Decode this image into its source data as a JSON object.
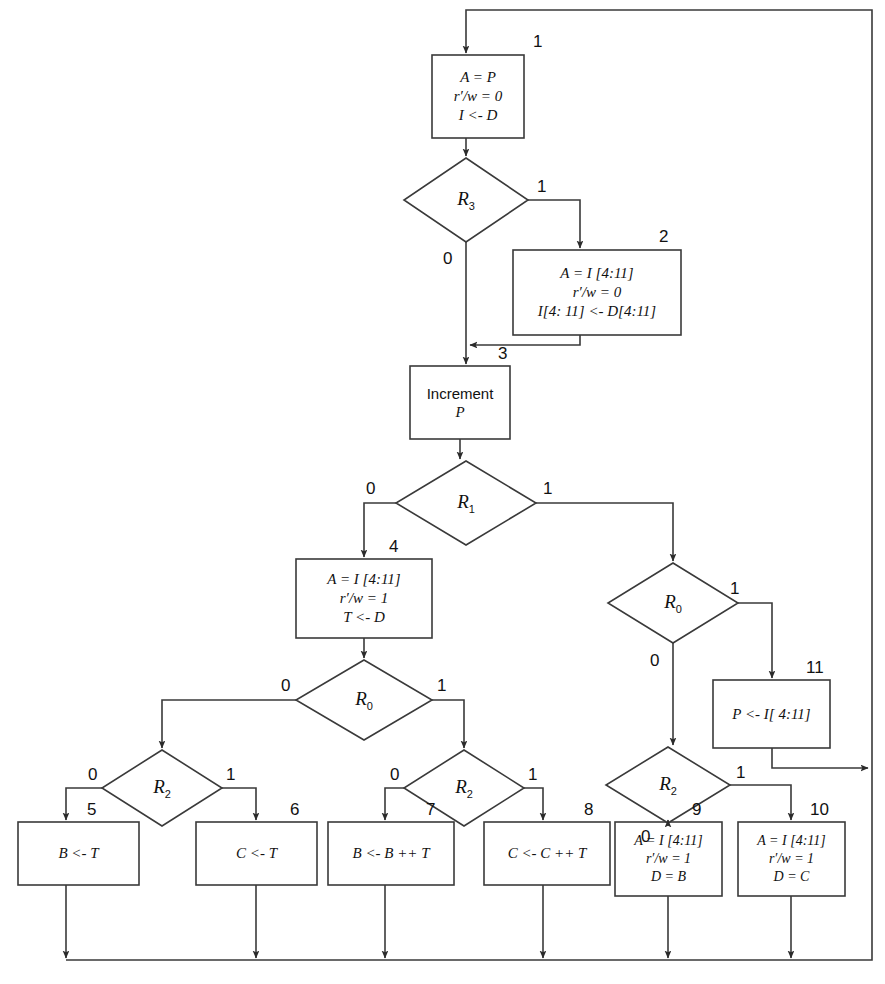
{
  "diagram": {
    "colors": {
      "line": "#3a3a3a",
      "text": "#111111",
      "background": "#ffffff"
    },
    "boxes": [
      {
        "num": "1",
        "lines": [
          "A = P",
          "r′/w = 0",
          "I <- D"
        ],
        "style": "italic"
      },
      {
        "num": "2",
        "lines": [
          "A = I [4:11]",
          "r′/w = 0",
          "I[4: 11] <- D[4:11]"
        ],
        "style": "italic"
      },
      {
        "num": "3",
        "lines": [
          "Increment",
          "P"
        ],
        "style": "plain"
      },
      {
        "num": "4",
        "lines": [
          "A = I [4:11]",
          "r′/w = 1",
          "T <- D"
        ],
        "style": "italic"
      },
      {
        "num": "5",
        "lines": [
          "B <- T"
        ],
        "style": "italic"
      },
      {
        "num": "6",
        "lines": [
          "C <- T"
        ],
        "style": "italic"
      },
      {
        "num": "7",
        "lines": [
          "B <- B ++ T"
        ],
        "style": "italic"
      },
      {
        "num": "8",
        "lines": [
          "C <- C ++ T"
        ],
        "style": "italic"
      },
      {
        "num": "9",
        "lines": [
          "A = I [4:11]",
          "r′/w = 1",
          "D = B"
        ],
        "style": "italic"
      },
      {
        "num": "10",
        "lines": [
          "A = I [4:11]",
          "r′/w = 1",
          "D = C"
        ],
        "style": "italic"
      },
      {
        "num": "11",
        "lines": [
          "P <- I[ 4:11]"
        ],
        "style": "italic"
      }
    ],
    "decisions": [
      {
        "id": "d-r3",
        "name": "R",
        "sub": "3",
        "branch_right": "1",
        "branch_bottom": "0"
      },
      {
        "id": "d-r1",
        "name": "R",
        "sub": "1",
        "branch_left": "0",
        "branch_right": "1"
      },
      {
        "id": "d-r0-mid",
        "name": "R",
        "sub": "0",
        "branch_left": "0",
        "branch_right": "1"
      },
      {
        "id": "d-r0-rgt",
        "name": "R",
        "sub": "0",
        "branch_right": "1",
        "branch_bottom": "0"
      },
      {
        "id": "d-r2-a",
        "name": "R",
        "sub": "2",
        "branch_left": "0",
        "branch_right": "1"
      },
      {
        "id": "d-r2-b",
        "name": "R",
        "sub": "2",
        "branch_left": "0",
        "branch_right": "1"
      },
      {
        "id": "d-r2-c",
        "name": "R",
        "sub": "2",
        "branch_right": "1",
        "branch_bottom": "0"
      }
    ],
    "branch_labels": {
      "zero": "0",
      "one": "1"
    }
  }
}
